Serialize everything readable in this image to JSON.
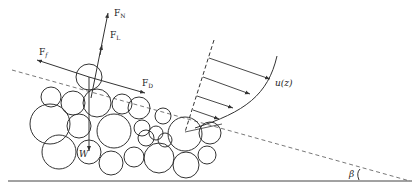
{
  "figure": {
    "type": "sediment-particle-force-diagram",
    "colors": {
      "stroke": "#333333",
      "background": "#ffffff"
    },
    "labels": {
      "normal_force": {
        "main": "F",
        "sub": "N"
      },
      "lift_force": {
        "main": "F",
        "sub": "L"
      },
      "friction_force": {
        "main": "F",
        "sub": "f"
      },
      "drag_force": {
        "main": "F",
        "sub": "D"
      },
      "weight": "W",
      "velocity_profile": "u(z)",
      "slope_angle": "β"
    },
    "particles": [
      {
        "id": "top-particle",
        "cx": 89,
        "cy": 77,
        "r": 13
      },
      {
        "cx": 51,
        "cy": 97,
        "r": 10
      },
      {
        "cx": 73,
        "cy": 103,
        "r": 12
      },
      {
        "cx": 97,
        "cy": 103,
        "r": 14
      },
      {
        "cx": 122,
        "cy": 104,
        "r": 10
      },
      {
        "cx": 50,
        "cy": 124,
        "r": 20
      },
      {
        "cx": 79,
        "cy": 126,
        "r": 12
      },
      {
        "cx": 114,
        "cy": 131,
        "r": 17
      },
      {
        "cx": 139,
        "cy": 108,
        "r": 11
      },
      {
        "cx": 146,
        "cy": 138,
        "r": 8
      },
      {
        "cx": 156,
        "cy": 133,
        "r": 7
      },
      {
        "cx": 163,
        "cy": 116,
        "r": 8
      },
      {
        "cx": 165,
        "cy": 140,
        "r": 7
      },
      {
        "cx": 185,
        "cy": 134,
        "r": 17
      },
      {
        "cx": 210,
        "cy": 133,
        "r": 11
      },
      {
        "cx": 59,
        "cy": 152,
        "r": 17
      },
      {
        "cx": 89,
        "cy": 152,
        "r": 12
      },
      {
        "cx": 111,
        "cy": 163,
        "r": 12
      },
      {
        "cx": 134,
        "cy": 157,
        "r": 10
      },
      {
        "cx": 159,
        "cy": 158,
        "r": 15
      },
      {
        "cx": 186,
        "cy": 165,
        "r": 13
      },
      {
        "cx": 207,
        "cy": 155,
        "r": 9
      },
      {
        "cx": 142,
        "cy": 128,
        "r": 8
      }
    ],
    "geometry": {
      "bed_line": {
        "x1": 8,
        "y1": 181,
        "x2": 412,
        "y2": 181
      },
      "slope_line": {
        "x1": 12,
        "y1": 70,
        "x2": 410,
        "y2": 181
      },
      "velocity_axis": {
        "x1": 214,
        "y1": 40,
        "x2": 185,
        "y2": 132
      },
      "velocity_arrows": [
        {
          "x1": 209,
          "y1": 58,
          "x2": 270,
          "y2": 79
        },
        {
          "x1": 203,
          "y1": 77,
          "x2": 250,
          "y2": 94
        },
        {
          "x1": 197,
          "y1": 96,
          "x2": 233,
          "y2": 108
        },
        {
          "x1": 193,
          "y1": 110,
          "x2": 219,
          "y2": 119
        }
      ]
    }
  }
}
